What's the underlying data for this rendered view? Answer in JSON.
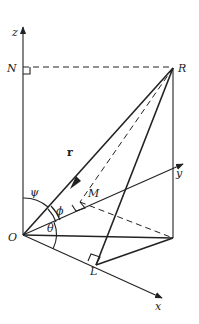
{
  "figure": {
    "labels": {
      "z": "z",
      "y": "y",
      "x": "x",
      "N": "N",
      "R": "R",
      "M": "M",
      "O": "O",
      "L": "L",
      "r": "r",
      "psi": "ψ",
      "phi": "ϕ",
      "theta": "θ"
    },
    "colors": {
      "ink": "#222222",
      "background": "#ffffff"
    },
    "points": {
      "O": [
        23,
        235
      ],
      "N": [
        23,
        67
      ],
      "R": [
        173,
        68
      ],
      "P": [
        173,
        238
      ],
      "M": [
        80,
        202
      ],
      "L": [
        96,
        265
      ]
    }
  }
}
